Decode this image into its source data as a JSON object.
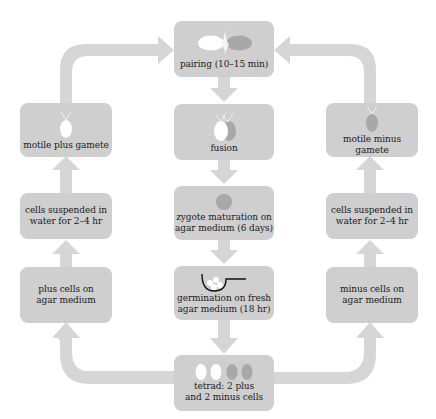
{
  "diagram": {
    "colors": {
      "box": "#cfcfcf",
      "arrow": "#d6d6d6",
      "plus_cell": "#ffffff",
      "minus_cell": "#a8a8a8",
      "text": "#1c1c1c"
    },
    "center": {
      "pairing": "pairing (10–15 min)",
      "fusion": "fusion",
      "zygote": "zygote maturation on\nagar medium (6 days)",
      "germination": "germination on fresh\nagar medium (18 hr)",
      "tetrad": "tetrad: 2 plus\nand 2 minus cells"
    },
    "left": {
      "motile": "motile plus gamete",
      "suspended": "cells suspended in\nwater for 2–4 hr",
      "agar": "plus cells on\nagar medium"
    },
    "right": {
      "motile": "motile minus gamete",
      "suspended": "cells suspended in\nwater for 2–4 hr",
      "agar": "minus cells on\nagar medium"
    },
    "flow": [
      "tetrad → plus cells on agar medium → cells suspended in water → motile plus gamete → pairing",
      "tetrad → minus cells on agar medium → cells suspended in water → motile minus gamete → pairing",
      "pairing → fusion → zygote maturation → germination → tetrad"
    ]
  }
}
